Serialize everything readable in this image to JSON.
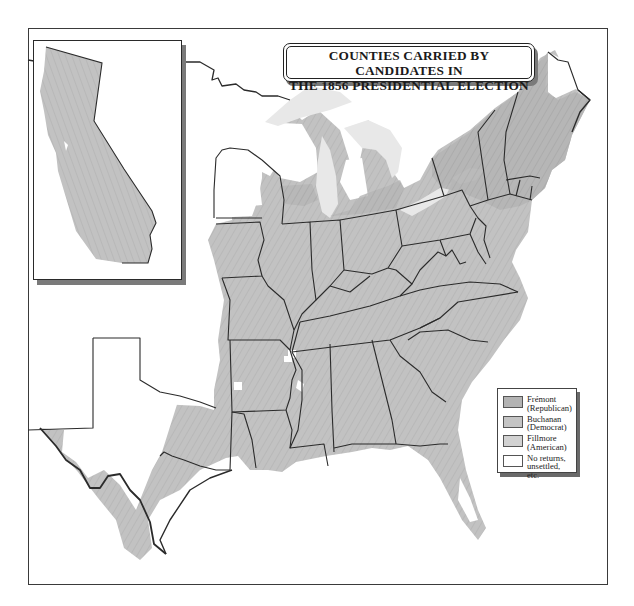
{
  "map": {
    "title_line1": "COUNTIES CARRIED BY CANDIDATES IN",
    "title_line2": "THE 1856 PRESIDENTIAL ELECTION",
    "inset_label": "California",
    "colors": {
      "fremont": "#b3b3b3",
      "buchanan": "#c4c4c4",
      "fillmore": "#d2d2d2",
      "no_returns": "#ffffff",
      "water": "#e6e6e6",
      "state_border": "#2b2b2b"
    }
  },
  "legend": {
    "items": [
      {
        "line1": "Frémont",
        "line2": "(Republican)",
        "color": "#b3b3b3"
      },
      {
        "line1": "Buchanan",
        "line2": "(Democrat)",
        "color": "#c4c4c4"
      },
      {
        "line1": "Fillmore",
        "line2": "(American)",
        "color": "#d2d2d2"
      },
      {
        "line1": "No returns,",
        "line2": "unsettled, etc.",
        "color": "#ffffff"
      }
    ]
  }
}
